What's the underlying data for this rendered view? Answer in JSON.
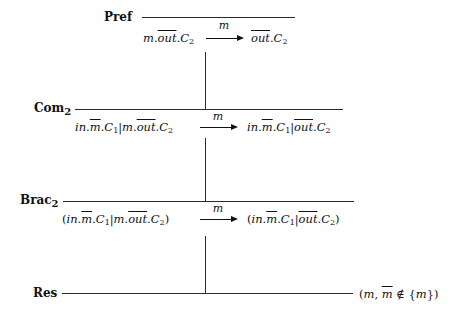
{
  "diagram": {
    "type": "derivation-tree",
    "rules": [
      {
        "name": "Pref",
        "label_main": "Pref",
        "label_sub": "",
        "conclusion": {
          "source": "m.out.C2",
          "action": "m",
          "target": "out.C2"
        }
      },
      {
        "name": "Com2",
        "label_main": "Com",
        "label_sub": "2",
        "conclusion": {
          "source": "in.m̄.C1|m.out.C2",
          "action": "m",
          "target": "in.m̄.C1|out.C2"
        }
      },
      {
        "name": "Brac2",
        "label_main": "Brac",
        "label_sub": "2",
        "conclusion": {
          "source": "(in.m̄.C1|m.out.C2)",
          "action": "m",
          "target": "(in.m̄.C1|out.C2)"
        }
      },
      {
        "name": "Res",
        "label_main": "Res",
        "label_sub": "",
        "side_condition": "(m, m̄ ∉ {m})"
      }
    ],
    "text": {
      "pref_label": "Pref",
      "com_label": "Com",
      "com_sub": "2",
      "brac_label": "Brac",
      "brac_sub": "2",
      "res_label": "Res",
      "arrow_action": "m",
      "m": "m",
      "in": "in",
      "out": "out",
      "C": "C",
      "one": "1",
      "two": "2",
      "dot": ".",
      "bar": "|",
      "lparen": "(",
      "rparen": ")",
      "res_cond_open": "(",
      "res_cond_mid": ", ",
      "res_cond_notin": " ∉ {",
      "res_cond_close": "})"
    }
  }
}
